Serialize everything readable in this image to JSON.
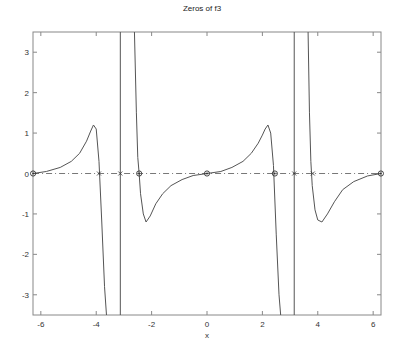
{
  "chart_data": {
    "type": "line",
    "title": "Zeros of f3",
    "xlabel": "x",
    "ylabel": "",
    "xlim": [
      -6.2832,
      6.2832
    ],
    "ylim": [
      -3.5,
      3.5
    ],
    "grid": false,
    "xticks": [
      -6,
      -4,
      -2,
      0,
      2,
      4,
      6
    ],
    "yticks": [
      -3,
      -2,
      -1,
      0,
      1,
      2,
      3
    ],
    "series": [
      {
        "name": "f3",
        "style": "solid",
        "color": "#555555",
        "segments": [
          {
            "x": [
              -6.28,
              -5.8,
              -5.3,
              -4.9,
              -4.6,
              -4.35,
              -4.2,
              -4.1,
              -4.0,
              -3.9,
              -3.8,
              -3.7,
              -3.63
            ],
            "y": [
              0.0,
              0.05,
              0.15,
              0.3,
              0.5,
              0.8,
              1.05,
              1.2,
              1.1,
              0.3,
              -1.2,
              -2.8,
              -3.5
            ]
          },
          {
            "x": [
              -3.13,
              -3.13
            ],
            "y": [
              -3.5,
              3.5
            ]
          },
          {
            "x": [
              -2.62,
              -2.55,
              -2.5,
              -2.45,
              -2.4,
              -2.3,
              -2.2,
              -2.05,
              -1.85,
              -1.6,
              -1.3,
              -0.9,
              -0.5,
              0.0
            ],
            "y": [
              3.5,
              1.5,
              0.4,
              0.0,
              -0.5,
              -1.0,
              -1.2,
              -1.05,
              -0.75,
              -0.5,
              -0.3,
              -0.15,
              -0.05,
              0.0
            ]
          },
          {
            "x": [
              0.0,
              0.5,
              0.9,
              1.3,
              1.6,
              1.85,
              2.0,
              2.1,
              2.2,
              2.3,
              2.4,
              2.5,
              2.6,
              2.66
            ],
            "y": [
              0.0,
              0.05,
              0.15,
              0.3,
              0.5,
              0.75,
              0.95,
              1.1,
              1.2,
              1.0,
              0.2,
              -1.5,
              -3.0,
              -3.5
            ]
          },
          {
            "x": [
              3.15,
              3.15
            ],
            "y": [
              -3.5,
              3.5
            ]
          },
          {
            "x": [
              3.65,
              3.7,
              3.75,
              3.8,
              3.9,
              4.0,
              4.15,
              4.35,
              4.6,
              4.9,
              5.3,
              5.8,
              6.28
            ],
            "y": [
              3.5,
              1.5,
              0.3,
              -0.3,
              -0.9,
              -1.15,
              -1.2,
              -1.0,
              -0.7,
              -0.4,
              -0.2,
              -0.06,
              0.0
            ]
          }
        ]
      },
      {
        "name": "zero-line",
        "style": "dashed",
        "color": "#555555",
        "x": [
          -6.28,
          6.28
        ],
        "y": [
          0,
          0
        ]
      }
    ],
    "markers": {
      "circles": [
        {
          "x": -6.28,
          "y": 0
        },
        {
          "x": -2.45,
          "y": 0
        },
        {
          "x": 0.0,
          "y": 0
        },
        {
          "x": 2.45,
          "y": 0
        },
        {
          "x": 6.28,
          "y": 0
        }
      ],
      "crosses": [
        {
          "x": -3.9,
          "y": 0
        },
        {
          "x": -3.13,
          "y": 0
        },
        {
          "x": 3.15,
          "y": 0
        },
        {
          "x": 3.82,
          "y": 0
        }
      ]
    }
  }
}
